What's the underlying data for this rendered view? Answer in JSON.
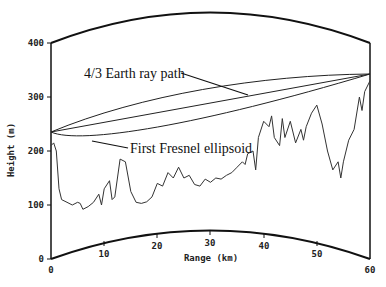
{
  "chart_data": {
    "type": "line",
    "title": "",
    "xlabel": "Range (km)",
    "ylabel": "Height (m)",
    "xlim": [
      0,
      60
    ],
    "ylim": [
      0,
      400
    ],
    "x_ticks": [
      0,
      10,
      20,
      30,
      40,
      50,
      60
    ],
    "y_ticks": [
      0,
      100,
      200,
      300,
      400
    ],
    "grid": false,
    "legend": null,
    "annotations": [
      {
        "text": "4/3 Earth ray path",
        "points_to": "ray path line"
      },
      {
        "text": "First Fresnel ellipsoid",
        "points_to": "ellipsoid lower boundary"
      }
    ],
    "ray_path": {
      "start": [
        0,
        230
      ],
      "end": [
        60,
        340
      ]
    },
    "fresnel_ellipsoid": {
      "start": [
        0,
        230
      ],
      "end": [
        60,
        340
      ],
      "max_half_width_m": 35
    },
    "earth_bulge": {
      "top_peak_height_at_30km": 455,
      "bottom_peak_height_at_30km": 52
    },
    "series": [
      {
        "name": "Terrain profile",
        "x": [
          0,
          0.5,
          1,
          1.5,
          2,
          3,
          4,
          5,
          5.5,
          6,
          7,
          8,
          9,
          9.5,
          10,
          11,
          11.5,
          12,
          13,
          14,
          15,
          16,
          17,
          18,
          19,
          20,
          21,
          22,
          23,
          24,
          25,
          26,
          27,
          28,
          29,
          30,
          31,
          32,
          33,
          34,
          35,
          36,
          36.5,
          37,
          38,
          38.5,
          39,
          40,
          41,
          41.5,
          42,
          43,
          43.5,
          44,
          45,
          46,
          47,
          47.5,
          48,
          49,
          50,
          51,
          52,
          53,
          54,
          54.5,
          55,
          56,
          57,
          58,
          58.5,
          59,
          60
        ],
        "values": [
          210,
          215,
          200,
          130,
          110,
          105,
          100,
          105,
          103,
          92,
          97,
          105,
          120,
          100,
          130,
          145,
          110,
          115,
          185,
          180,
          125,
          105,
          103,
          106,
          115,
          140,
          135,
          160,
          150,
          170,
          150,
          155,
          138,
          135,
          148,
          142,
          150,
          148,
          155,
          160,
          170,
          180,
          175,
          195,
          200,
          165,
          225,
          255,
          245,
          265,
          225,
          210,
          260,
          225,
          255,
          215,
          240,
          220,
          245,
          270,
          285,
          250,
          200,
          165,
          180,
          150,
          180,
          220,
          240,
          300,
          275,
          310,
          330
        ]
      }
    ]
  },
  "labels": {
    "ray_annotation": "4/3 Earth ray path",
    "fresnel_annotation": "First Fresnel ellipsoid",
    "x_axis_title": "Range (km)",
    "y_axis_title": "Height (m)",
    "y_tick_0": "0",
    "y_tick_100": "100",
    "y_tick_200": "200",
    "y_tick_300": "300",
    "y_tick_400": "400",
    "x_tick_0": "0",
    "x_tick_10": "10",
    "x_tick_20": "20",
    "x_tick_30": "30",
    "x_tick_40": "40",
    "x_tick_50": "50",
    "x_tick_60": "60"
  }
}
